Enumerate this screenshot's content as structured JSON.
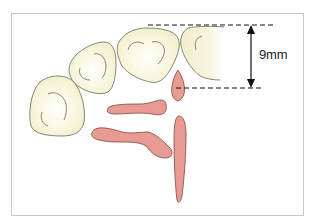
{
  "diagram": {
    "type": "dental-arch-diagram",
    "measurement": {
      "label": "9mm",
      "description": "vertical distance between two dashed reference lines"
    },
    "elements": {
      "teeth_count": 4,
      "papillae_count": 4
    },
    "colors": {
      "tooth_fill": "#f6f3d8",
      "tooth_highlight": "#ffffff",
      "tooth_outline": "#6a6a55",
      "papilla_fill": "#e99a92",
      "papilla_outline": "#7a4a45",
      "dimension_line": "#111111",
      "frame_border": "#c8c8c8"
    }
  }
}
